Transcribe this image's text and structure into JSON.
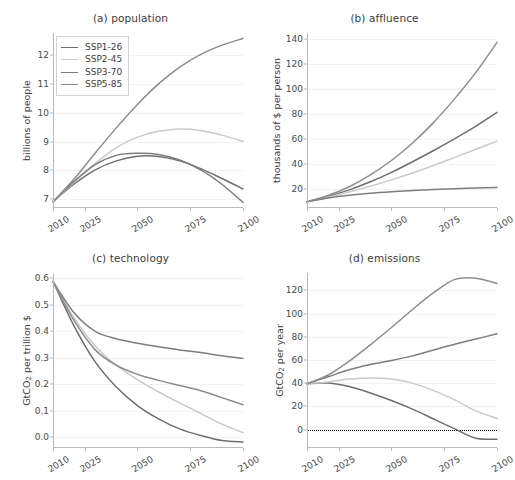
{
  "figure": {
    "width": 515,
    "height": 480,
    "background": "#ffffff",
    "grid_color": "#f2f2f2",
    "axis_color": "#b9b9b9",
    "text_color": "#3c3c3c"
  },
  "legend": {
    "position": "upper-left-panel-a",
    "entries": [
      {
        "label": "SSP1-26",
        "color": "#6e6e6e"
      },
      {
        "label": "SSP2-45",
        "color": "#c9c9c9"
      },
      {
        "label": "SSP3-70",
        "color": "#7d7d7d"
      },
      {
        "label": "SSP5-85",
        "color": "#8d8d8d"
      }
    ]
  },
  "x_ticks": [
    "2010",
    "2025",
    "2050",
    "2075",
    "2100"
  ],
  "x_tick_values": [
    2010,
    2025,
    2050,
    2075,
    2100
  ],
  "chart_data": [
    {
      "id": "a",
      "type": "line",
      "title": "(a) population",
      "xlabel": "",
      "ylabel": "billions of people",
      "ylabel_html": "billions of people",
      "xlim": [
        2010,
        2100
      ],
      "ylim": [
        6.7,
        12.75
      ],
      "yticks": [
        7,
        8,
        9,
        10,
        11,
        12
      ],
      "ytick_labels": [
        "7",
        "8",
        "9",
        "10",
        "11",
        "12"
      ],
      "grid": true,
      "x": [
        2010,
        2020,
        2030,
        2040,
        2050,
        2060,
        2070,
        2080,
        2090,
        2100
      ],
      "series": [
        {
          "name": "SSP1-26",
          "color": "#6e6e6e",
          "values": [
            6.92,
            7.53,
            8.02,
            8.33,
            8.49,
            8.48,
            8.33,
            8.06,
            7.72,
            7.36
          ]
        },
        {
          "name": "SSP2-45",
          "color": "#c9c9c9",
          "values": [
            6.92,
            7.59,
            8.24,
            8.79,
            9.15,
            9.35,
            9.43,
            9.38,
            9.22,
            9.0
          ]
        },
        {
          "name": "SSP3-70",
          "color": "#7d7d7d",
          "values": [
            6.92,
            7.62,
            8.2,
            8.52,
            8.59,
            8.55,
            8.36,
            8.02,
            7.52,
            6.89
          ]
        },
        {
          "name": "SSP5-85",
          "color": "#8d8d8d",
          "values": [
            6.92,
            7.7,
            8.6,
            9.47,
            10.28,
            10.99,
            11.57,
            12.01,
            12.33,
            12.56
          ]
        }
      ]
    },
    {
      "id": "b",
      "type": "line",
      "title": "(b) affluence",
      "xlabel": "",
      "ylabel": "thousands of $ per person",
      "ylabel_html": "thousands of $ per person",
      "xlim": [
        2010,
        2100
      ],
      "ylim": [
        5,
        145
      ],
      "yticks": [
        20,
        40,
        60,
        80,
        100,
        120,
        140
      ],
      "ytick_labels": [
        "20",
        "40",
        "60",
        "80",
        "100",
        "120",
        "140"
      ],
      "grid": true,
      "x": [
        2010,
        2020,
        2030,
        2040,
        2050,
        2060,
        2070,
        2080,
        2090,
        2100
      ],
      "series": [
        {
          "name": "SSP1-26",
          "color": "#6e6e6e",
          "values": [
            10.0,
            14.2,
            19.5,
            26.0,
            33.5,
            42.0,
            51.0,
            60.5,
            70.5,
            81.5
          ]
        },
        {
          "name": "SSP2-45",
          "color": "#c9c9c9",
          "values": [
            10.0,
            13.8,
            17.8,
            22.5,
            27.5,
            33.0,
            39.0,
            45.5,
            52.0,
            58.5
          ]
        },
        {
          "name": "SSP3-70",
          "color": "#7d7d7d",
          "values": [
            10.0,
            13.0,
            15.2,
            16.8,
            18.0,
            19.0,
            19.8,
            20.4,
            21.0,
            21.5
          ]
        },
        {
          "name": "SSP5-85",
          "color": "#8d8d8d",
          "values": [
            10.0,
            15.0,
            22.0,
            31.5,
            43.0,
            57.0,
            73.5,
            92.5,
            113.5,
            137.5
          ]
        }
      ]
    },
    {
      "id": "c",
      "type": "line",
      "title": "(c) technology",
      "xlabel": "",
      "ylabel": "GtCO2 per trillion $",
      "ylabel_html": "GtCO<sub>2</sub> per trillion $",
      "xlim": [
        2010,
        2100
      ],
      "ylim": [
        -0.04,
        0.62
      ],
      "yticks": [
        0.0,
        0.1,
        0.2,
        0.3,
        0.4,
        0.5,
        0.6
      ],
      "ytick_labels": [
        "0.0",
        "0.1",
        "0.2",
        "0.3",
        "0.4",
        "0.5",
        "0.6"
      ],
      "grid": true,
      "x": [
        2010,
        2020,
        2030,
        2040,
        2050,
        2060,
        2070,
        2080,
        2090,
        2100
      ],
      "series": [
        {
          "name": "SSP1-26",
          "color": "#6e6e6e",
          "values": [
            0.588,
            0.42,
            0.285,
            0.19,
            0.12,
            0.07,
            0.032,
            0.007,
            -0.012,
            -0.017
          ]
        },
        {
          "name": "SSP2-45",
          "color": "#c9c9c9",
          "values": [
            0.588,
            0.45,
            0.345,
            0.272,
            0.218,
            0.172,
            0.13,
            0.09,
            0.05,
            0.018
          ]
        },
        {
          "name": "SSP3-70",
          "color": "#7d7d7d",
          "values": [
            0.588,
            0.47,
            0.4,
            0.372,
            0.355,
            0.342,
            0.33,
            0.32,
            0.308,
            0.298
          ]
        },
        {
          "name": "SSP5-85",
          "color": "#8d8d8d",
          "values": [
            0.588,
            0.44,
            0.33,
            0.272,
            0.238,
            0.215,
            0.196,
            0.176,
            0.15,
            0.123
          ]
        }
      ]
    },
    {
      "id": "d",
      "type": "line",
      "title": "(d) emissions",
      "xlabel": "",
      "ylabel": "GtCO2 per year",
      "ylabel_html": "GtCO<sub>2</sub> per year",
      "xlim": [
        2010,
        2100
      ],
      "ylim": [
        -16,
        135
      ],
      "yticks": [
        0,
        20,
        40,
        60,
        80,
        100,
        120
      ],
      "ytick_labels": [
        "0",
        "20",
        "40",
        "60",
        "80",
        "100",
        "120"
      ],
      "grid": true,
      "zero_line": true,
      "zero_line_style": "dotted",
      "zero_line_color": "#000000",
      "x": [
        2010,
        2020,
        2030,
        2040,
        2050,
        2060,
        2070,
        2080,
        2090,
        2100
      ],
      "series": [
        {
          "name": "SSP1-26",
          "color": "#6e6e6e",
          "values": [
            39.5,
            40.0,
            37.0,
            31.5,
            25.0,
            17.5,
            9.0,
            0.5,
            -7.5,
            -8.5
          ]
        },
        {
          "name": "SSP2-45",
          "color": "#c9c9c9",
          "values": [
            39.5,
            41.0,
            43.5,
            44.5,
            43.5,
            40.0,
            33.5,
            25.5,
            16.0,
            9.5
          ]
        },
        {
          "name": "SSP3-70",
          "color": "#7d7d7d",
          "values": [
            39.5,
            45.5,
            51.5,
            56.0,
            59.5,
            63.5,
            68.5,
            73.5,
            78.0,
            82.5
          ]
        },
        {
          "name": "SSP5-85",
          "color": "#8d8d8d",
          "values": [
            39.5,
            47.0,
            59.0,
            73.0,
            88.0,
            103.5,
            118.0,
            129.5,
            130.5,
            126.0
          ]
        }
      ]
    }
  ]
}
